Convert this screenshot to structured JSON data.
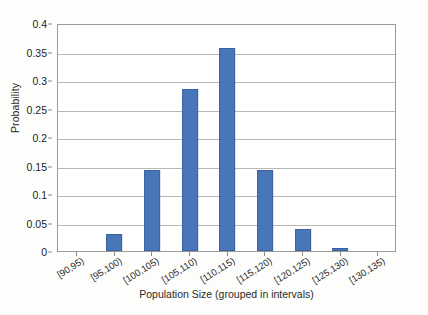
{
  "chart_data": {
    "type": "bar",
    "title": "",
    "xlabel": "Population Size (grouped in intervals)",
    "ylabel": "Probability",
    "categories": [
      "[90,95)",
      "[95,100)",
      "[100,105)",
      "[105,110)",
      "[110,115)",
      "[115,120)",
      "[120,125)",
      "[125,130)",
      "[130,135)"
    ],
    "values": [
      0,
      0.029,
      0.143,
      0.285,
      0.357,
      0.143,
      0.039,
      0.005,
      0
    ],
    "ylim": [
      0,
      0.4
    ],
    "ytick_values": [
      0,
      0.05,
      0.1,
      0.15,
      0.2,
      0.25,
      0.3,
      0.35,
      0.4
    ],
    "ytick_labels": [
      "0",
      "0.05",
      "0.1",
      "0.15",
      "0.2",
      "0.25",
      "0.3",
      "0.35",
      "0.4"
    ],
    "grid": true,
    "legend": false,
    "bar_color": "#4876b8",
    "plot_background": "#ffffff",
    "grid_color": "#b7b7b7",
    "axis_color": "#9a9a9a"
  }
}
